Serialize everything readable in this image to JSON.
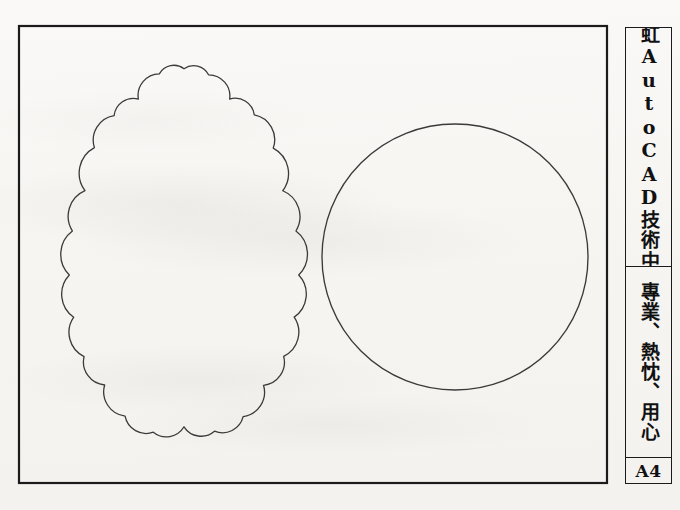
{
  "sheet": {
    "background_color": "#f7f6f3",
    "ink_color": "#1b1b1b",
    "width": 680,
    "height": 510
  },
  "border": {
    "name": "drawing-frame",
    "x": 19,
    "y": 26,
    "width": 588,
    "height": 457,
    "stroke": "#1b1b1b",
    "stroke_width": 2.2
  },
  "title_block": {
    "company": "翔虹AutoCAD技術中心",
    "slogan": "專業、熱忱、用心",
    "sheet_size": "A4",
    "x": 625,
    "y": 27,
    "width": 47,
    "height": 457
  },
  "shapes": [
    {
      "name": "revision-cloud",
      "type": "scalloped-cloud",
      "center_x": 184,
      "center_y": 253,
      "bounds": {
        "x": 58,
        "y": 72,
        "width": 252,
        "height": 362
      },
      "stroke": "#3a3a3a",
      "stroke_width": 1.3,
      "fill": "none"
    },
    {
      "name": "circle",
      "type": "circle",
      "center_x": 455,
      "center_y": 257,
      "radius": 133,
      "stroke": "#3a3a3a",
      "stroke_width": 1.3,
      "fill": "none"
    }
  ]
}
